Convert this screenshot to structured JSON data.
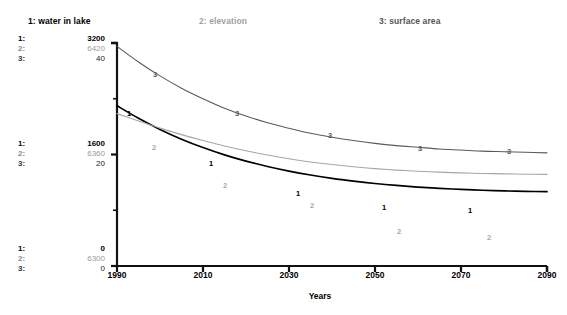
{
  "legend": [
    {
      "key": "1",
      "label": "1: water in lake",
      "color": "#000000"
    },
    {
      "key": "2",
      "label": "2: elevation",
      "color": "#9f9f9f"
    },
    {
      "key": "3",
      "label": "3: surface area",
      "color": "#555555"
    }
  ],
  "scale_keys": {
    "k1": "1:",
    "k2": "2:",
    "k3": "3:"
  },
  "scale_blocks": {
    "top": {
      "v1": "3200",
      "v2": "6420",
      "v3": "40"
    },
    "middle": {
      "v1": "1600",
      "v2": "6360",
      "v3": "20"
    },
    "bottom": {
      "v1": "0",
      "v2": "6300",
      "v3": "0"
    }
  },
  "xaxis": {
    "title": "Years",
    "ticks": [
      "1990",
      "2010",
      "2030",
      "2050",
      "2070",
      "2090"
    ]
  },
  "curve_markers": [
    {
      "series": "1",
      "text": "1",
      "x": 129,
      "y": 114
    },
    {
      "series": "1",
      "text": "1",
      "x": 211,
      "y": 164
    },
    {
      "series": "1",
      "text": "1",
      "x": 298,
      "y": 194
    },
    {
      "series": "1",
      "text": "1",
      "x": 384,
      "y": 208
    },
    {
      "series": "1",
      "text": "1",
      "x": 470,
      "y": 211
    },
    {
      "series": "2",
      "text": "2",
      "x": 154,
      "y": 148
    },
    {
      "series": "2",
      "text": "2",
      "x": 225,
      "y": 186
    },
    {
      "series": "2",
      "text": "2",
      "x": 312,
      "y": 206
    },
    {
      "series": "2",
      "text": "2",
      "x": 399,
      "y": 232
    },
    {
      "series": "2",
      "text": "2",
      "x": 489,
      "y": 238
    },
    {
      "series": "3",
      "text": "3",
      "x": 155,
      "y": 75
    },
    {
      "series": "3",
      "text": "3",
      "x": 237,
      "y": 114
    },
    {
      "series": "3",
      "text": "3",
      "x": 330,
      "y": 136
    },
    {
      "series": "3",
      "text": "3",
      "x": 420,
      "y": 149
    },
    {
      "series": "3",
      "text": "3",
      "x": 509,
      "y": 152
    }
  ],
  "chart_data": {
    "type": "line",
    "title": "",
    "xlabel": "Years",
    "ylabel": "",
    "grid": false,
    "legend_position": "top",
    "x": [
      1990,
      1995,
      2000,
      2005,
      2010,
      2015,
      2020,
      2025,
      2030,
      2035,
      2040,
      2045,
      2050,
      2055,
      2060,
      2065,
      2070,
      2075,
      2080,
      2085,
      2090
    ],
    "xlim": [
      1990,
      2090
    ],
    "xticks": [
      1990,
      2010,
      2030,
      2050,
      2070,
      2090
    ],
    "axes": [
      {
        "series": "1",
        "name": "water in lake",
        "ylim": [
          0,
          3200
        ],
        "yticks": [
          0,
          1600,
          3200
        ],
        "color": "#000000"
      },
      {
        "series": "2",
        "name": "elevation",
        "ylim": [
          6300,
          6420
        ],
        "yticks": [
          6300,
          6360,
          6420
        ],
        "color": "#a6a6a6"
      },
      {
        "series": "3",
        "name": "surface area",
        "ylim": [
          0,
          40
        ],
        "yticks": [
          0,
          20,
          40
        ],
        "color": "#5a5a5a"
      }
    ],
    "series": [
      {
        "name": "water in lake",
        "key": "1",
        "color": "#000000",
        "axis": 1,
        "units": "",
        "values": [
          2300,
          2120,
          1960,
          1820,
          1700,
          1595,
          1505,
          1428,
          1362,
          1306,
          1258,
          1218,
          1184,
          1156,
          1133,
          1114,
          1099,
          1087,
          1078,
          1071,
          1066
        ]
      },
      {
        "name": "elevation",
        "key": "2",
        "color": "#a6a6a6",
        "axis": 2,
        "units": "",
        "values": [
          6382.0,
          6378.0,
          6374.2,
          6370.7,
          6367.5,
          6364.6,
          6362.0,
          6359.7,
          6357.7,
          6356.0,
          6354.6,
          6353.4,
          6352.4,
          6351.6,
          6351.0,
          6350.5,
          6350.1,
          6349.8,
          6349.6,
          6349.4,
          6349.3
        ]
      },
      {
        "name": "surface area",
        "key": "3",
        "color": "#5a5a5a",
        "axis": 3,
        "units": "",
        "values": [
          39.4,
          36.6,
          34.1,
          31.9,
          30.0,
          28.3,
          26.9,
          25.7,
          24.7,
          23.8,
          23.1,
          22.5,
          22.0,
          21.6,
          21.3,
          21.0,
          20.8,
          20.6,
          20.5,
          20.4,
          20.3
        ]
      }
    ]
  },
  "geometry": {
    "plot_left": 117,
    "plot_right": 547,
    "plot_top": 43,
    "plot_bottom": 266
  }
}
